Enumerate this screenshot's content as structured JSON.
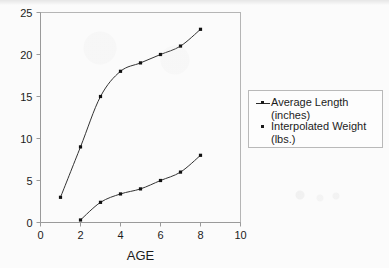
{
  "chart_data": {
    "type": "line",
    "title": "",
    "xlabel": "AGE",
    "ylabel": "",
    "xlim": [
      0,
      10
    ],
    "ylim": [
      0,
      25
    ],
    "xticks": [
      "0",
      "2",
      "4",
      "6",
      "8",
      "10"
    ],
    "xtick_values": [
      0,
      2,
      4,
      6,
      8,
      10
    ],
    "yticks": [
      "0",
      "5",
      "10",
      "15",
      "20",
      "25"
    ],
    "ytick_values": [
      0,
      5,
      10,
      15,
      20,
      25
    ],
    "grid": false,
    "legend_position": "right",
    "marker": "square",
    "line_color": "#333333",
    "marker_color": "#111111",
    "series": [
      {
        "name": "Average Length (inches)",
        "legend_line1": "Average Length",
        "legend_line2": "(inches)",
        "x": [
          1,
          2,
          3,
          4,
          5,
          6,
          7,
          8
        ],
        "values": [
          3,
          9,
          15,
          18,
          19,
          20,
          21,
          23
        ]
      },
      {
        "name": "Interpolated Weight (lbs.)",
        "legend_line1": "Interpolated Weight",
        "legend_line2": "(lbs.)",
        "x": [
          2,
          3,
          4,
          5,
          6,
          7,
          8
        ],
        "values": [
          0.3,
          2.4,
          3.4,
          4,
          5,
          6,
          8
        ]
      }
    ]
  },
  "axis": {
    "x_label": "AGE"
  },
  "colors": {
    "background": "#fbfbfb",
    "axis": "#9a9a9a",
    "plot_border": "#b5b5b5",
    "text": "#1c1c1c",
    "series_line": "#333333"
  }
}
